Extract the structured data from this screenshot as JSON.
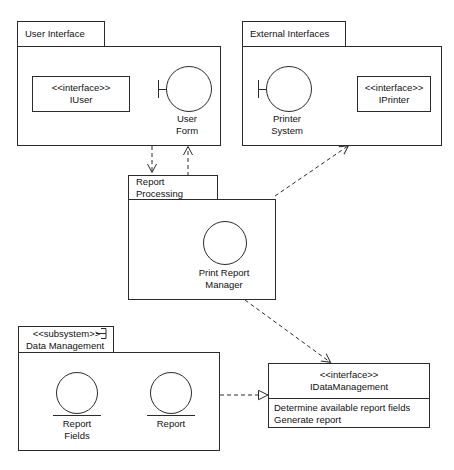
{
  "diagram": {
    "stroke_color": "#2b2b2b",
    "text_color": "#111111",
    "background": "#ffffff"
  },
  "packages": [
    {
      "id": "user-interface",
      "name": "User Interface",
      "stereotype": ""
    },
    {
      "id": "external-interfaces",
      "name": "External Interfaces",
      "stereotype": ""
    },
    {
      "id": "report-processing",
      "name": "Report Processing",
      "stereotype": ""
    },
    {
      "id": "data-management",
      "name": "Data Management",
      "stereotype": "<<subsystem>>"
    }
  ],
  "interfaces": [
    {
      "id": "iuser",
      "stereotype": "<<interface>>",
      "name": "IUser",
      "operations": []
    },
    {
      "id": "iprinter",
      "stereotype": "<<interface>>",
      "name": "IPrinter",
      "operations": []
    },
    {
      "id": "idatamanagement",
      "stereotype": "<<interface>>",
      "name": "IDataManagement",
      "operations": [
        "Determine available report fields",
        "Generate report"
      ]
    }
  ],
  "components": [
    {
      "id": "user-form",
      "line1": "User",
      "line2": "Form",
      "port": "left-socket"
    },
    {
      "id": "printer-system",
      "line1": "Printer",
      "line2": "System",
      "port": "left-socket"
    },
    {
      "id": "print-report-manager",
      "line1": "Print Report",
      "line2": "Manager",
      "port": "self-loop-arrow"
    },
    {
      "id": "report-fields",
      "line1": "Report",
      "line2": "Fields",
      "port": "underline"
    },
    {
      "id": "report",
      "line1": "Report",
      "line2": "",
      "port": "underline"
    }
  ],
  "connectors": [
    {
      "id": "userform-to-iuser",
      "kind": "realization",
      "style": "dashed",
      "arrow": "hollow-triangle",
      "from": "user-form",
      "to": "iuser"
    },
    {
      "id": "printersystem-to-iprinter",
      "kind": "dependency",
      "style": "dashed",
      "arrow": "open",
      "from": "printer-system",
      "to": "iprinter"
    },
    {
      "id": "ui-to-reportprocessing",
      "kind": "dependency",
      "style": "dashed",
      "arrow": "open",
      "from": "user-interface",
      "to": "report-processing"
    },
    {
      "id": "reportprocessing-to-ui",
      "kind": "dependency",
      "style": "dashed",
      "arrow": "open",
      "from": "report-processing",
      "to": "user-interface"
    },
    {
      "id": "reportprocessing-to-external",
      "kind": "dependency",
      "style": "dashed",
      "arrow": "open",
      "from": "report-processing",
      "to": "external-interfaces"
    },
    {
      "id": "reportprocessing-to-idatamanagement",
      "kind": "dependency",
      "style": "dashed",
      "arrow": "open",
      "from": "report-processing",
      "to": "idatamanagement"
    },
    {
      "id": "datamanagement-to-idatamanagement",
      "kind": "realization",
      "style": "dashed",
      "arrow": "hollow-triangle",
      "from": "data-management",
      "to": "idatamanagement"
    }
  ]
}
